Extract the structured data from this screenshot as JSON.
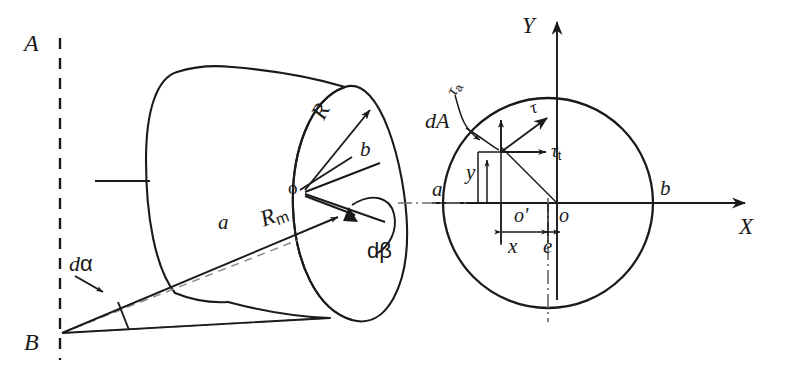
{
  "figure": {
    "background_color": "#ffffff",
    "stroke_color": "#1a1a1a",
    "dashed_color": "#8c8c8c"
  },
  "left_panel": {
    "name": "cylinder-segment-3d",
    "labels": {
      "axis_top": "A",
      "axis_bottom": "B",
      "center": "o",
      "point_a": "a",
      "point_b": "b",
      "radius_outer": "R",
      "radius_mean_base": "R",
      "radius_mean_sub": "m",
      "angle_alpha_d": "d",
      "angle_alpha_sym": "α",
      "angle_beta_d": "d",
      "angle_beta_sym": "β"
    }
  },
  "right_panel": {
    "name": "circular-cross-section",
    "labels": {
      "axis_x": "X",
      "axis_y": "Y",
      "origin": "o",
      "centroid": "o'",
      "point_a": "a",
      "point_b": "b",
      "area_element": "dA",
      "dim_x": "x",
      "dim_y": "y",
      "eccentricity": "e",
      "tau": "τ",
      "tau_a_base": "τ",
      "tau_a_sub": "a",
      "tau_t_base": "τ",
      "tau_t_sub": "t"
    }
  }
}
